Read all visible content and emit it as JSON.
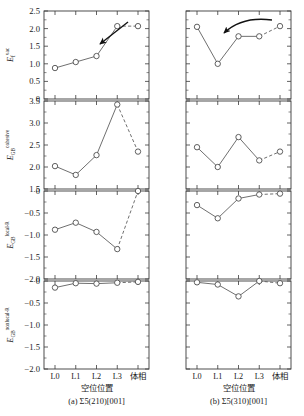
{
  "figure": {
    "rows": 4,
    "cols": 2,
    "axis_color": "#3a3a3a",
    "line_color": "#555555",
    "marker_edge": "#444444",
    "marker_face": "#ffffff"
  },
  "columns": [
    {
      "id": "a",
      "caption": "(a)  Σ5(210)[001]",
      "xlabel": "空位位置"
    },
    {
      "id": "b",
      "caption": "(b)  Σ5(310)[001]",
      "xlabel": "空位位置"
    }
  ],
  "xcategories": [
    "L0",
    "L1",
    "L2",
    "L3",
    "体相"
  ],
  "ylabels": [
    {
      "base": "E",
      "sub": "f",
      "sup": "vac"
    },
    {
      "base": "E",
      "sub": "GB",
      "sup": "cohesive"
    },
    {
      "base": "E",
      "sub": "GB",
      "sup": "local-R"
    },
    {
      "base": "E",
      "sub": "GB",
      "sup": "nonlocal-R"
    }
  ],
  "ytick_labels": [
    [
      "0",
      "0.5",
      "1.0",
      "1.5",
      "2.0",
      "2.5"
    ],
    [
      "1.5",
      "2.0",
      "2.5",
      "3.0",
      "3.5"
    ],
    [
      "−2.0",
      "−1.5",
      "−1.0",
      "−0.5",
      "0"
    ],
    [
      "−2.0",
      "−1.5",
      "−1.0",
      "−0.5",
      "0"
    ]
  ],
  "annotations": [
    {
      "panel": "a1",
      "type": "arrow-straight",
      "note": "downward-left arrow"
    },
    {
      "panel": "b1",
      "type": "arrow-curved",
      "note": "curved arrow pointing down-left"
    }
  ],
  "chart_data": [
    {
      "type": "line",
      "panel": "a1",
      "title": "",
      "xlabel": "空位位置",
      "ylabel": "E_f^vac",
      "categories": [
        "L0",
        "L1",
        "L2",
        "L3",
        "体相"
      ],
      "values": [
        0.88,
        1.05,
        1.22,
        2.07,
        2.07
      ],
      "ylim": [
        0,
        2.5
      ],
      "yticks": [
        0,
        0.5,
        1.0,
        1.5,
        2.0,
        2.5
      ],
      "dashed_last_segment": true,
      "grid": false,
      "legend": "none"
    },
    {
      "type": "line",
      "panel": "b1",
      "title": "",
      "xlabel": "空位位置",
      "ylabel": "E_f^vac",
      "categories": [
        "L0",
        "L1",
        "L2",
        "L3",
        "体相"
      ],
      "values": [
        2.05,
        1.0,
        1.78,
        1.78,
        2.07
      ],
      "ylim": [
        0,
        2.5
      ],
      "yticks": [
        0,
        0.5,
        1.0,
        1.5,
        2.0,
        2.5
      ],
      "dashed_last_segment": true,
      "grid": false,
      "legend": "none"
    },
    {
      "type": "line",
      "panel": "a2",
      "title": "",
      "xlabel": "空位位置",
      "ylabel": "E_GB^cohesive",
      "categories": [
        "L0",
        "L1",
        "L2",
        "L3",
        "体相"
      ],
      "values": [
        2.02,
        1.82,
        2.27,
        3.42,
        2.35
      ],
      "ylim": [
        1.5,
        3.5
      ],
      "yticks": [
        1.5,
        2.0,
        2.5,
        3.0,
        3.5
      ],
      "dashed_last_segment": true,
      "grid": false,
      "legend": "none"
    },
    {
      "type": "line",
      "panel": "b2",
      "title": "",
      "xlabel": "空位位置",
      "ylabel": "E_GB^cohesive",
      "categories": [
        "L0",
        "L1",
        "L2",
        "L3",
        "体相"
      ],
      "values": [
        2.45,
        2.0,
        2.68,
        2.15,
        2.35
      ],
      "ylim": [
        1.5,
        3.5
      ],
      "yticks": [
        1.5,
        2.0,
        2.5,
        3.0,
        3.5
      ],
      "dashed_last_segment": true,
      "grid": false,
      "legend": "none"
    },
    {
      "type": "line",
      "panel": "a3",
      "title": "",
      "xlabel": "空位位置",
      "ylabel": "E_GB^local-R",
      "categories": [
        "L0",
        "L1",
        "L2",
        "L3",
        "体相"
      ],
      "values": [
        -0.88,
        -0.72,
        -0.93,
        -1.32,
        0.0
      ],
      "ylim": [
        -2.0,
        0
      ],
      "yticks": [
        -2.0,
        -1.5,
        -1.0,
        -0.5,
        0
      ],
      "dashed_last_segment": true,
      "grid": false,
      "legend": "none"
    },
    {
      "type": "line",
      "panel": "b3",
      "title": "",
      "xlabel": "空位位置",
      "ylabel": "E_GB^local-R",
      "categories": [
        "L0",
        "L1",
        "L2",
        "L3",
        "体相"
      ],
      "values": [
        -0.32,
        -0.62,
        -0.17,
        -0.08,
        -0.06
      ],
      "ylim": [
        -2.0,
        0
      ],
      "yticks": [
        -2.0,
        -1.5,
        -1.0,
        -0.5,
        0
      ],
      "dashed_last_segment": true,
      "grid": false,
      "legend": "none"
    },
    {
      "type": "line",
      "panel": "a4",
      "title": "",
      "xlabel": "空位位置",
      "ylabel": "E_GB^nonlocal-R",
      "categories": [
        "L0",
        "L1",
        "L2",
        "L3",
        "体相"
      ],
      "values": [
        -0.15,
        -0.05,
        -0.06,
        -0.04,
        -0.02
      ],
      "ylim": [
        -2.0,
        0
      ],
      "yticks": [
        -2.0,
        -1.5,
        -1.0,
        -0.5,
        0
      ],
      "dashed_last_segment": true,
      "grid": false,
      "legend": "none"
    },
    {
      "type": "line",
      "panel": "b4",
      "title": "",
      "xlabel": "空位位置",
      "ylabel": "E_GB^nonlocal-R",
      "categories": [
        "L0",
        "L1",
        "L2",
        "L3",
        "体相"
      ],
      "values": [
        -0.03,
        -0.08,
        -0.35,
        0.0,
        -0.05
      ],
      "ylim": [
        -2.0,
        0
      ],
      "yticks": [
        -2.0,
        -1.5,
        -1.0,
        -0.5,
        0
      ],
      "dashed_last_segment": true,
      "grid": false,
      "legend": "none"
    }
  ]
}
